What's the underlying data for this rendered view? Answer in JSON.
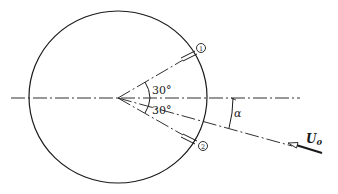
{
  "diagram": {
    "type": "geometry-schematic",
    "angle_upper_label": "30°",
    "angle_lower_label": "30°",
    "alpha_label": "α",
    "flow_label_main": "U",
    "flow_label_sub": "0",
    "tap_1_label": "1",
    "tap_2_label": "2",
    "colors": {
      "line": "#1a1a1a",
      "background": "#ffffff"
    }
  }
}
